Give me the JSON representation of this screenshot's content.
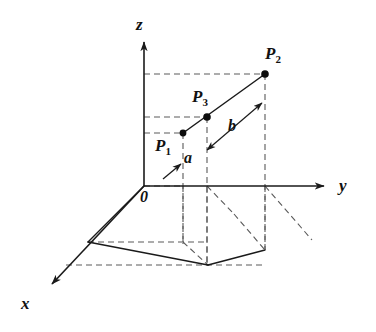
{
  "figure": {
    "type": "3d-coordinate-diagram",
    "background_color": "#ffffff",
    "ink_color": "#1a1a1a",
    "dash_color": "#555555"
  },
  "axes": {
    "z": {
      "label": "z",
      "label_x": 139,
      "label_y": 18,
      "from": [
        144,
        186
      ],
      "to": [
        144,
        36
      ],
      "arrow": true
    },
    "y": {
      "label": "y",
      "label_x": 341,
      "label_y": 178,
      "from": [
        144,
        186
      ],
      "to": [
        330,
        186
      ],
      "arrow": true
    },
    "x": {
      "label": "x",
      "label_x": 22,
      "label_y": 296,
      "from": [
        144,
        186
      ],
      "to": [
        48,
        288
      ],
      "arrow": true
    },
    "origin": {
      "label": "0",
      "label_x": 141,
      "label_y": 189
    }
  },
  "points": [
    {
      "name": "P1",
      "label": "P",
      "subscript": "1",
      "x": 183,
      "y": 133,
      "label_x": 156,
      "label_y": 138,
      "dot": true
    },
    {
      "name": "P3",
      "label": "P",
      "subscript": "3",
      "x": 207,
      "y": 117,
      "label_x": 191,
      "label_y": 89,
      "dot": true
    },
    {
      "name": "P2",
      "label": "P",
      "subscript": "2",
      "x": 265,
      "y": 74,
      "label_x": 266,
      "label_y": 46,
      "dot": true
    }
  ],
  "segments": [
    {
      "name": "a",
      "label": "a",
      "label_x": 185,
      "label_y": 150,
      "arrow_from": [
        163,
        178
      ],
      "arrow_to": [
        180,
        165
      ]
    },
    {
      "name": "b",
      "label": "b",
      "label_x": 229,
      "label_y": 119,
      "arrow_from": [
        205,
        149
      ],
      "arrow_to": [
        262,
        103
      ]
    }
  ],
  "main_line": {
    "from": [
      183,
      133
    ],
    "to": [
      265,
      74
    ],
    "style": "solid",
    "through": "P1-P3-P2"
  },
  "projection_plane": {
    "solid_edges": [
      [
        [
          144,
          186
        ],
        [
          88,
          242
        ]
      ],
      [
        [
          88,
          242
        ],
        [
          208,
          265
        ]
      ],
      [
        [
          208,
          265
        ],
        [
          265,
          250
        ]
      ]
    ],
    "dashed_edges": [
      [
        [
          144,
          186
        ],
        [
          183,
          186
        ]
      ],
      [
        [
          88,
          242
        ],
        [
          208,
          242
        ]
      ],
      [
        [
          66,
          265
        ],
        [
          265,
          265
        ]
      ],
      [
        [
          183,
          186
        ],
        [
          183,
          242
        ]
      ],
      [
        [
          207,
          186
        ],
        [
          207,
          265
        ]
      ],
      [
        [
          265,
          186
        ],
        [
          265,
          250
        ]
      ],
      [
        [
          183,
          242
        ],
        [
          208,
          265
        ]
      ],
      [
        [
          207,
          186
        ],
        [
          232,
          212
        ]
      ],
      [
        [
          232,
          212
        ],
        [
          265,
          250
        ]
      ],
      [
        [
          265,
          186
        ],
        [
          310,
          238
        ]
      ]
    ]
  },
  "guide_lines": {
    "horizontal_dashed": [
      {
        "from": [
          144,
          74
        ],
        "to": [
          265,
          74
        ],
        "to_point": "P2"
      },
      {
        "from": [
          144,
          117
        ],
        "to": [
          207,
          117
        ],
        "to_point": "P3"
      },
      {
        "from": [
          144,
          133
        ],
        "to": [
          183,
          133
        ],
        "to_point": "P1"
      }
    ],
    "vertical_dashed": [
      {
        "from": [
          183,
          133
        ],
        "to": [
          183,
          242
        ],
        "from_point": "P1"
      },
      {
        "from": [
          207,
          117
        ],
        "to": [
          207,
          265
        ],
        "from_point": "P3"
      },
      {
        "from": [
          265,
          74
        ],
        "to": [
          265,
          250
        ],
        "from_point": "P2"
      }
    ]
  },
  "watermark": {
    "text": "",
    "x": 286,
    "y": 264
  }
}
